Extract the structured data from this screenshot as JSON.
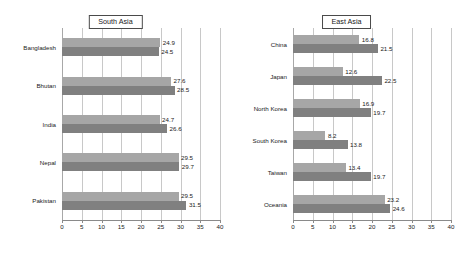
{
  "chart_data": [
    {
      "type": "bar",
      "title": "South Asia",
      "orientation": "horizontal",
      "grid": true,
      "legend": "none",
      "xlabel": "",
      "ylabel": "",
      "xlim": [
        0,
        40
      ],
      "xticks": [
        0,
        5,
        10,
        15,
        20,
        25,
        30,
        35,
        40
      ],
      "categories": [
        "Bangladesh",
        "Bhutan",
        "India",
        "Nepal",
        "Pakistan"
      ],
      "series": [
        {
          "name": "series-1",
          "color": "#a6a6a6",
          "values": [
            24.9,
            27.6,
            24.7,
            29.5,
            29.5
          ]
        },
        {
          "name": "series-2",
          "color": "#808080",
          "values": [
            24.5,
            28.5,
            26.6,
            29.7,
            31.5
          ]
        }
      ]
    },
    {
      "type": "bar",
      "title": "East Asia",
      "orientation": "horizontal",
      "grid": true,
      "legend": "none",
      "xlabel": "",
      "ylabel": "",
      "xlim": [
        0,
        40
      ],
      "xticks": [
        0,
        5,
        10,
        15,
        20,
        25,
        30,
        35,
        40
      ],
      "categories": [
        "China",
        "Japan",
        "North Korea",
        "South Korea",
        "Taiwan",
        "Oceania"
      ],
      "series": [
        {
          "name": "series-1",
          "color": "#a6a6a6",
          "values": [
            16.8,
            12.6,
            16.9,
            8.2,
            13.4,
            23.2
          ]
        },
        {
          "name": "series-2",
          "color": "#808080",
          "values": [
            21.5,
            22.5,
            19.7,
            13.8,
            19.7,
            24.6
          ]
        }
      ]
    }
  ]
}
